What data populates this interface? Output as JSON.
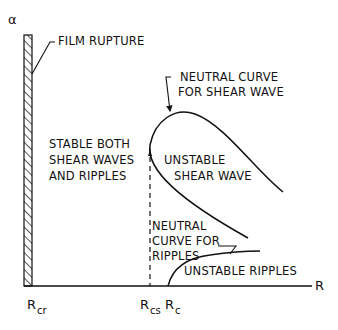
{
  "diagram": {
    "axes": {
      "y_label": "α",
      "x_label": "R"
    },
    "x_ticks": [
      {
        "main": "R",
        "sub": "cr"
      },
      {
        "main": "R",
        "sub": "cs"
      },
      {
        "main": "R",
        "sub": "c"
      }
    ],
    "labels": {
      "film_rupture": "FILM RUPTURE",
      "neutral_shear_1": "NEUTRAL CURVE",
      "neutral_shear_2": "FOR SHEAR WAVE",
      "stable_1": "STABLE BOTH",
      "stable_2": "SHEAR WAVES",
      "stable_3": "AND RIPPLES",
      "unstable_shear_1": "UNSTABLE",
      "unstable_shear_2": "SHEAR WAVE",
      "neutral_ripples_1": "NEUTRAL",
      "neutral_ripples_2": "CURVE FOR",
      "neutral_ripples_3": "RIPPLES",
      "unstable_ripples": "UNSTABLE RIPPLES"
    },
    "colors": {
      "ink": "#111111",
      "background": "#ffffff"
    }
  }
}
